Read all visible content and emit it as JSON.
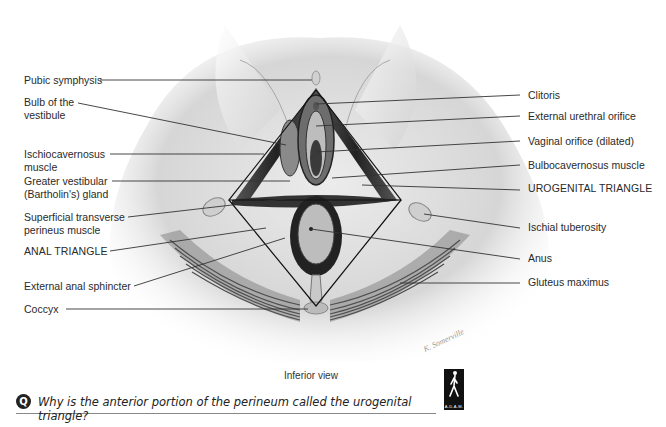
{
  "diagram": {
    "view_caption": "Inferior view",
    "labels_left": [
      {
        "id": "pubic-symphysis",
        "text": "Pubic symphysis",
        "x": 24,
        "y": 74
      },
      {
        "id": "bulb-of-vestibule",
        "text": "Bulb of the\nvestibule",
        "x": 24,
        "y": 96
      },
      {
        "id": "ischiocavernosus",
        "text": "Ischiocavernosus\nmuscle",
        "x": 24,
        "y": 148
      },
      {
        "id": "greater-vestibular-gland",
        "text": "Greater vestibular\n(Bartholin's) gland",
        "x": 24,
        "y": 175
      },
      {
        "id": "superficial-transverse-perineus",
        "text": "Superficial transverse\nperineus muscle",
        "x": 24,
        "y": 211
      },
      {
        "id": "anal-triangle",
        "text": "ANAL TRIANGLE",
        "x": 24,
        "y": 245
      },
      {
        "id": "external-anal-sphincter",
        "text": "External anal sphincter",
        "x": 24,
        "y": 280
      },
      {
        "id": "coccyx",
        "text": "Coccyx",
        "x": 24,
        "y": 303
      }
    ],
    "labels_right": [
      {
        "id": "clitoris",
        "text": "Clitoris",
        "x": 528,
        "y": 89
      },
      {
        "id": "external-urethral-orifice",
        "text": "External urethral orifice",
        "x": 528,
        "y": 110
      },
      {
        "id": "vaginal-orifice",
        "text": "Vaginal orifice (dilated)",
        "x": 528,
        "y": 135
      },
      {
        "id": "bulbocavernosus",
        "text": "Bulbocavernosus muscle",
        "x": 528,
        "y": 159
      },
      {
        "id": "urogenital-triangle",
        "text": "UROGENITAL TRIANGLE",
        "x": 528,
        "y": 182
      },
      {
        "id": "ischial-tuberosity",
        "text": "Ischial tuberosity",
        "x": 528,
        "y": 221
      },
      {
        "id": "anus",
        "text": "Anus",
        "x": 528,
        "y": 252
      },
      {
        "id": "gluteus-maximus",
        "text": "Gluteus maximus",
        "x": 528,
        "y": 276
      }
    ],
    "artist_signature": "K. Somerville"
  },
  "question": {
    "icon": "Q",
    "text": "Why is the anterior portion of the perineum called the urogenital triangle?"
  },
  "logo": {
    "text": "A.D.A.M."
  }
}
